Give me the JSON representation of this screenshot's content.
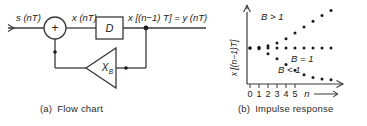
{
  "figure": {
    "panels": [
      {
        "id": "a",
        "tag": "(a)",
        "caption": "Flow chart",
        "nodes": {
          "input_label": "s (nT)",
          "sum_symbol": "+",
          "mid_label": "x (nT)",
          "delay_label": "D",
          "output_label": "x [(n−1) T] = y (nT)",
          "gain_label": "X",
          "gain_subscript": "B"
        }
      },
      {
        "id": "b",
        "tag": "(b)",
        "caption": "Impulse response"
      }
    ]
  },
  "chart_data": {
    "type": "scatter",
    "title": "Impulse response",
    "xlabel": "n",
    "ylabel": "x [(n−1)T]",
    "xlim": [
      -0.5,
      9.5
    ],
    "ylim": [
      0,
      10
    ],
    "grid": false,
    "legend_position": "inline-annotations",
    "x": [
      0,
      1,
      2,
      3,
      4,
      5,
      6,
      7,
      8,
      9
    ],
    "xticklabels": [
      "0",
      "1",
      "2",
      "3",
      "4",
      "5"
    ],
    "series": [
      {
        "name": "B > 1",
        "annotation": "B > 1",
        "annotation_xy": [
          2.6,
          7.8
        ],
        "values": [
          5.0,
          5.1,
          5.3,
          5.7,
          6.3,
          7.1,
          7.9,
          8.7,
          9.5,
          10.2
        ]
      },
      {
        "name": "B = 1",
        "annotation": "B = 1",
        "annotation_xy": [
          5.1,
          4.2
        ],
        "values": [
          5.0,
          5.0,
          5.0,
          5.0,
          5.0,
          5.0,
          5.0,
          5.0,
          5.0,
          5.0
        ]
      },
      {
        "name": "B < 1",
        "annotation": "B < 1",
        "annotation_xy": [
          4.2,
          3.0
        ],
        "values": [
          5.0,
          4.9,
          4.2,
          3.5,
          2.7,
          1.9,
          1.3,
          0.9,
          0.7,
          0.6
        ]
      }
    ]
  },
  "axis": {
    "x_arrow": true,
    "y_arrow": true,
    "x_var": "n",
    "ticks": [
      "0",
      "1",
      "2",
      "3",
      "4",
      "5"
    ]
  },
  "colors": {
    "ink": "#1a1a1a",
    "line": "#3a3a3a",
    "background": "#ffffff"
  }
}
